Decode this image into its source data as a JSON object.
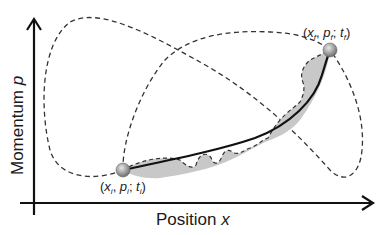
{
  "diagram": {
    "type": "phase-space path diagram",
    "x_axis": {
      "label": "Position",
      "variable": "x"
    },
    "y_axis": {
      "label": "Momentum",
      "variable": "p"
    },
    "initial_point": {
      "label": "(x_i, p_i; t_i)",
      "parts": {
        "open": "(",
        "x": "x",
        "xs": "i",
        "sep1": ", ",
        "p": "p",
        "ps": "i",
        "sep2": "; ",
        "t": "t",
        "ts": "i",
        "close": ")"
      }
    },
    "final_point": {
      "label": "(x_f, p_f; t_f)",
      "parts": {
        "open": "(",
        "x": "x",
        "xs": "f",
        "sep1": ", ",
        "p": "p",
        "ps": "f",
        "sep2": "; ",
        "t": "t",
        "ts": "f",
        "close": ")"
      }
    },
    "paths": [
      {
        "name": "classical path",
        "style": "solid",
        "color": "#111111"
      },
      {
        "name": "alternative path (left loop)",
        "style": "dashed",
        "color": "#333333"
      },
      {
        "name": "alternative path (right loop)",
        "style": "dashed",
        "color": "#333333"
      },
      {
        "name": "nearby fluctuating path",
        "style": "dashed-with-gray-fill",
        "color": "#333333",
        "fill": "#c8c8c8"
      }
    ],
    "colors": {
      "axis": "#111111",
      "point_fill": "#9a9a9a",
      "shading": "#c8c8c8"
    }
  }
}
